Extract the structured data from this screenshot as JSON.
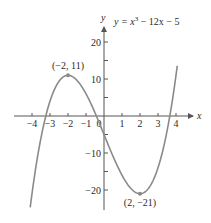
{
  "chart_data": {
    "type": "line",
    "equation": {
      "prefix": "y = x",
      "exp": "3",
      "suffix": " − 12x − 5"
    },
    "xlabel": "x",
    "ylabel": "y",
    "xlim": [
      -4.1,
      4.1
    ],
    "ylim": [
      -25,
      25
    ],
    "grid": false,
    "x_ticks": [
      -4,
      -3,
      -2,
      -1,
      0,
      1,
      2,
      3,
      4
    ],
    "x_tick_labels": [
      "−4",
      "−3",
      "−2",
      "−1",
      "0",
      "1",
      "2",
      "3",
      "4"
    ],
    "y_ticks": [
      20,
      10,
      -10,
      -20
    ],
    "y_tick_labels": [
      "20",
      "10",
      "−10",
      "−20"
    ],
    "y_minor_ticks": [
      15,
      5,
      -5,
      -15
    ],
    "series": [
      {
        "name": "y = x^3 - 12x - 5",
        "x": [
          -4.1,
          -4,
          -3.5,
          -3,
          -2.5,
          -2,
          -1.5,
          -1,
          -0.5,
          0,
          0.5,
          1,
          1.5,
          2,
          2.5,
          3,
          3.5,
          4,
          4.07
        ],
        "y": [
          -24.7,
          -21,
          -5.9,
          4,
          9.4,
          11,
          9.6,
          6,
          0.9,
          -5,
          -10.9,
          -16,
          -19.6,
          -21,
          -19.4,
          -14,
          -4.1,
          11,
          23
        ]
      }
    ],
    "annotations": [
      {
        "label": "(−2, 11)",
        "x": -2,
        "y": 11
      },
      {
        "label": "(2, −21)",
        "x": 2,
        "y": -21
      }
    ],
    "colors": {
      "curve": "#8a8a8a",
      "axis": "#555555",
      "point": "#8a8a8a"
    }
  }
}
